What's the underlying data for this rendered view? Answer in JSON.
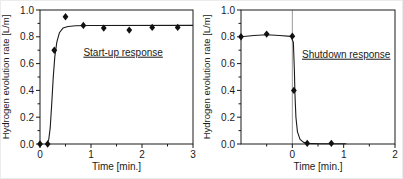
{
  "figure": {
    "background": "#ffffff",
    "line_color": "#1a1a1a",
    "marker_color": "#111111",
    "vline_color": "#9b9b9b"
  },
  "chart_data": [
    {
      "type": "scatter",
      "title": "",
      "annotation": "Start-up response",
      "annotation_xy": [
        1.63,
        0.685
      ],
      "xlabel": "Time [min.]",
      "ylabel": "Hydrogen evolution rate [L/m]",
      "xlim": [
        0,
        3
      ],
      "ylim": [
        0,
        1
      ],
      "grid": false,
      "marker": "diamond",
      "xticks": [
        {
          "v": 0,
          "label": "0"
        },
        {
          "v": 1,
          "label": "1"
        },
        {
          "v": 2,
          "label": "2"
        },
        {
          "v": 3,
          "label": "3"
        }
      ],
      "xticks_minor": [
        0.5,
        1.5,
        2.5
      ],
      "yticks": [
        {
          "v": 0.0,
          "label": "0.0"
        },
        {
          "v": 0.2,
          "label": "0.2"
        },
        {
          "v": 0.4,
          "label": "0.4"
        },
        {
          "v": 0.6,
          "label": "0.6"
        },
        {
          "v": 0.8,
          "label": "0.8"
        },
        {
          "v": 1.0,
          "label": "1.0"
        }
      ],
      "yticks_minor": [
        0.1,
        0.3,
        0.5,
        0.7,
        0.9
      ],
      "points": [
        [
          0,
          0
        ],
        [
          0.15,
          0
        ],
        [
          0.28,
          0.7
        ],
        [
          0.5,
          0.95
        ],
        [
          0.85,
          0.885
        ],
        [
          1.25,
          0.865
        ],
        [
          1.75,
          0.85
        ],
        [
          2.2,
          0.87
        ],
        [
          2.7,
          0.87
        ]
      ],
      "curve": [
        [
          0.13,
          0
        ],
        [
          0.17,
          0.03
        ],
        [
          0.2,
          0.12
        ],
        [
          0.23,
          0.3
        ],
        [
          0.26,
          0.5
        ],
        [
          0.29,
          0.65
        ],
        [
          0.33,
          0.76
        ],
        [
          0.38,
          0.83
        ],
        [
          0.45,
          0.865
        ],
        [
          0.55,
          0.877
        ],
        [
          0.7,
          0.882
        ],
        [
          1.0,
          0.884
        ],
        [
          3.0,
          0.885
        ]
      ]
    },
    {
      "type": "scatter",
      "title": "",
      "annotation": "Shutdown response",
      "annotation_xy": [
        1.05,
        0.67
      ],
      "xlabel": "Time [min.]",
      "ylabel": "Hydrogen evolution rate [L/m]",
      "xlim": [
        -1,
        2
      ],
      "ylim": [
        0,
        1
      ],
      "grid": false,
      "marker": "diamond",
      "vline_x": 0,
      "xticks": [
        {
          "v": 0,
          "label": "0"
        },
        {
          "v": 1,
          "label": "1"
        },
        {
          "v": 2,
          "label": "2"
        }
      ],
      "xticks_minor": [
        -0.5,
        0.5,
        1.5
      ],
      "yticks": [
        {
          "v": 0.0,
          "label": "0.0"
        },
        {
          "v": 0.2,
          "label": "0.2"
        },
        {
          "v": 0.4,
          "label": "0.4"
        },
        {
          "v": 0.6,
          "label": "0.6"
        },
        {
          "v": 0.8,
          "label": "0.8"
        },
        {
          "v": 1.0,
          "label": "1.0"
        }
      ],
      "yticks_minor": [
        0.1,
        0.3,
        0.5,
        0.7,
        0.9
      ],
      "points": [
        [
          -1,
          0.8
        ],
        [
          -0.5,
          0.82
        ],
        [
          0,
          0.805
        ],
        [
          0.03,
          0.4
        ],
        [
          0.29,
          0.005
        ],
        [
          0.76,
          0.005
        ]
      ],
      "curve": [
        [
          -1,
          0.8
        ],
        [
          -0.75,
          0.81
        ],
        [
          -0.5,
          0.815
        ],
        [
          -0.25,
          0.81
        ],
        [
          -0.03,
          0.803
        ],
        [
          0.02,
          0.76
        ],
        [
          0.04,
          0.55
        ],
        [
          0.05,
          0.38
        ],
        [
          0.07,
          0.2
        ],
        [
          0.1,
          0.09
        ],
        [
          0.15,
          0.035
        ],
        [
          0.22,
          0.012
        ],
        [
          0.3,
          0.005
        ],
        [
          0.55,
          0.002
        ],
        [
          1.05,
          0.002
        ]
      ]
    }
  ]
}
